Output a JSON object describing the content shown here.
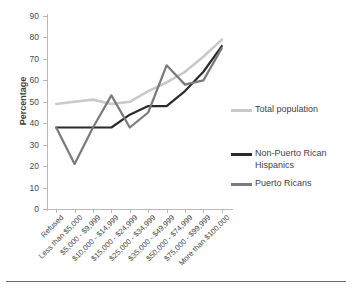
{
  "chart": {
    "type": "line",
    "title": "",
    "xlabel": "",
    "ylabel": "Percentage",
    "ylim": [
      0,
      90
    ],
    "ystep": 10,
    "grid": false,
    "legend_position": "right",
    "ytick_labels": [
      "90",
      "80",
      "70",
      "60",
      "50",
      "40",
      "30",
      "20",
      "10",
      "0"
    ],
    "categories": [
      "Refused",
      "Less than $5,000",
      "$5,000 - $9,999",
      "$10,000 - $14,999",
      "$15,000 - $24,999",
      "$25,000 - $34,999",
      "$35,000 - $49,999",
      "$50,000 - $74,999",
      "$75,000 - $99,999",
      "More than $100,000"
    ],
    "series": [
      {
        "name": "Total population",
        "color": "#c9c9c9",
        "values": [
          49,
          50,
          51,
          49,
          50,
          55,
          59,
          64,
          71,
          79
        ]
      },
      {
        "name": "Non-Puerto Rican Hispanics",
        "color": "#2b2b2b",
        "values": [
          38,
          38,
          38,
          38,
          44,
          48,
          48,
          55,
          64,
          76
        ]
      },
      {
        "name": "Puerto Ricans",
        "color": "#7a7a7a",
        "values": [
          38,
          21,
          38,
          53,
          38,
          45,
          67,
          58,
          60,
          75
        ]
      }
    ]
  },
  "chart_data": {
    "type": "line",
    "title": "",
    "xlabel": "",
    "ylabel": "Percentage",
    "ylim": [
      0,
      90
    ],
    "grid": false,
    "legend_position": "right",
    "categories": [
      "Refused",
      "Less than $5,000",
      "$5,000 - $9,999",
      "$10,000 - $14,999",
      "$15,000 - $24,999",
      "$25,000 - $34,999",
      "$35,000 - $49,999",
      "$50,000 - $74,999",
      "$75,000 - $99,999",
      "More than $100,000"
    ],
    "series": [
      {
        "name": "Total population",
        "values": [
          49,
          50,
          51,
          49,
          50,
          55,
          59,
          64,
          71,
          79
        ]
      },
      {
        "name": "Non-Puerto Rican Hispanics",
        "values": [
          38,
          38,
          38,
          38,
          44,
          48,
          48,
          55,
          64,
          76
        ]
      },
      {
        "name": "Puerto Ricans",
        "values": [
          38,
          21,
          38,
          53,
          38,
          45,
          67,
          58,
          60,
          75
        ]
      }
    ]
  },
  "legend": {
    "items": [
      {
        "label": "Total population",
        "color": "#c9c9c9"
      },
      {
        "label": "Non-Puerto Rican Hispanics",
        "color": "#2b2b2b"
      },
      {
        "label": "Puerto Ricans",
        "color": "#7a7a7a"
      }
    ]
  }
}
